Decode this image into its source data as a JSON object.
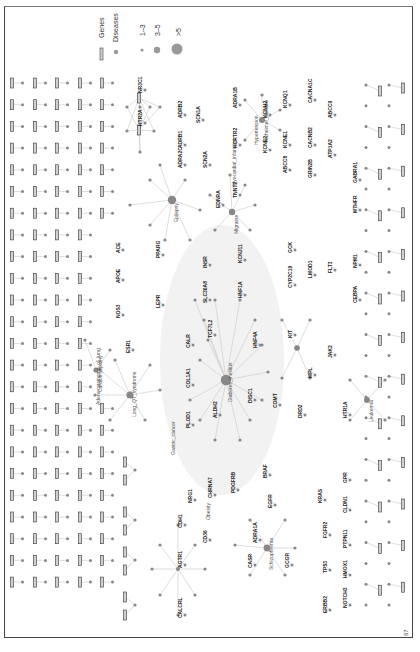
{
  "figure": {
    "orientation": "rotated-90",
    "page_number": "67",
    "legend": {
      "genes_label": "Genes",
      "diseases_label": "Diseases",
      "size_1_label": "1–3",
      "size_2_label": "3–5",
      "size_3_label": ">5"
    },
    "colors": {
      "gene_fill": "#d0d0d0",
      "gene_stroke": "#333333",
      "disease_fill": "#888888",
      "edge": "#c8c8c8",
      "hub_halo": "#eeeeee"
    },
    "disease_labels": [
      "Diabetes_mellitus",
      "Myocardial_infarction",
      "Alzheimer_disease",
      "Hypertension",
      "Migraine",
      "Epilepsy",
      "Cardiomyopathy",
      "Long_QT_syndrome",
      "Adenocarcinoma_of_lung",
      "Gastric_cancer",
      "Schizophrenia",
      "Leukemia",
      "Obesity"
    ],
    "gene_labels": [
      "NR3C1",
      "HTR2A",
      "ADRB2",
      "ADRB1",
      "ADRA2C",
      "SCN1A",
      "SCN2A",
      "EDNRA",
      "ADRA1B",
      "HCRTR2",
      "TNNT2",
      "KCNH2",
      "KCNE2",
      "KCNQ1",
      "KCNE1",
      "ABCC8",
      "CACNA1C",
      "CACNB2",
      "GRIN2B",
      "ABCC9",
      "ATP1A2",
      "GABRA1",
      "MTHFR",
      "ACE",
      "APOE",
      "NOS3",
      "ESR1",
      "PPARG",
      "LEPR",
      "INSR",
      "SLC30A8",
      "TCF7L2",
      "KCNJ11",
      "HNF1A",
      "HNF4A",
      "GCK",
      "CYP2C19",
      "LMOD1",
      "FLT3",
      "NPM1",
      "CEBPA",
      "KIT",
      "MPL",
      "JAK2",
      "CALR",
      "COL1A1",
      "PLOD1",
      "ALDH2",
      "DISC1",
      "COMT",
      "DRD2",
      "HTR1A",
      "NRG1",
      "CHRNA7",
      "PDGFRB",
      "BRAF",
      "EGFR",
      "KRAS",
      "FGFR2",
      "TP53",
      "ERBB2",
      "CDH1",
      "AGTR1",
      "CD36",
      "CASR",
      "ADRA1A",
      "GCGR",
      "CALCRL",
      "GPR",
      "CLDN1",
      "PTPN11",
      "HMOX1",
      "NOTCH3",
      "GRIA1",
      "SCNN1A",
      "SCNN1G",
      "SCNN1B",
      "GPR39",
      "HDAC2",
      "IL6R"
    ]
  }
}
